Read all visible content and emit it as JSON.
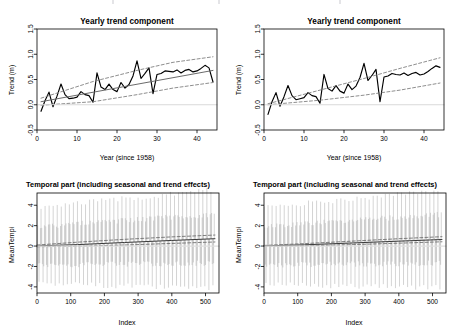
{
  "figure": {
    "layout": "2x2 panel grid",
    "background_color": "#ffffff",
    "panels": [
      {
        "id": "top-left",
        "title": "Yearly trend component",
        "xlabel": "Year (since 1958)",
        "ylabel": "Trend (m)"
      },
      {
        "id": "top-right",
        "title": "Yearly trend component",
        "xlabel": "Year (since 1958)",
        "ylabel": "Trend (m)"
      },
      {
        "id": "bottom-left",
        "title": "Temporal part (including seasonal and trend effects)",
        "xlabel": "Index",
        "ylabel": "MeanTempi"
      },
      {
        "id": "bottom-right",
        "title": "Temporal part (including seasonal and trend effects)",
        "xlabel": "Index",
        "ylabel": "MeanTempi"
      }
    ]
  },
  "colors": {
    "data_line": "#000000",
    "fit_line": "#6b6b6b",
    "confidence_dashed": "#7a7a7a",
    "spike": "#a8a8a8",
    "zero_line": "#d9d9d9",
    "axis": "#000000",
    "background": "#ffffff"
  },
  "chart_data": [
    {
      "type": "line",
      "id": "top-left",
      "title": "Yearly trend component",
      "xlabel": "Year (since 1958)",
      "ylabel": "Trend (m)",
      "grid": false,
      "legend": "none",
      "xlim": [
        0,
        45
      ],
      "ylim": [
        -0.5,
        1.5
      ],
      "xticks": [
        0,
        10,
        20,
        30,
        40
      ],
      "yticks": [
        -0.5,
        0.0,
        0.5,
        1.0,
        1.5
      ],
      "ytick_labels": [
        "-0.5",
        "0.0",
        "0.5",
        "1.0",
        "1.5"
      ],
      "xtick_labels": [
        "0",
        "10",
        "20",
        "30",
        "40"
      ],
      "series": [
        {
          "name": "yearly trend (observed)",
          "style": "solid",
          "color": "#000000",
          "x": [
            1,
            2,
            3,
            4,
            5,
            6,
            7,
            8,
            9,
            10,
            11,
            12,
            13,
            14,
            15,
            16,
            17,
            18,
            19,
            20,
            21,
            22,
            23,
            24,
            25,
            26,
            27,
            28,
            29,
            30,
            31,
            32,
            33,
            34,
            35,
            36,
            37,
            38,
            39,
            40,
            41,
            42,
            43,
            44
          ],
          "y": [
            -0.13,
            0.08,
            0.25,
            -0.04,
            0.17,
            0.41,
            0.2,
            0.12,
            0.13,
            0.15,
            0.26,
            0.2,
            0.18,
            0.05,
            0.63,
            0.35,
            0.3,
            0.41,
            0.3,
            0.26,
            0.44,
            0.33,
            0.4,
            0.57,
            0.87,
            0.52,
            0.62,
            0.73,
            0.22,
            0.6,
            0.62,
            0.67,
            0.66,
            0.65,
            0.69,
            0.63,
            0.68,
            0.7,
            0.65,
            0.67,
            0.72,
            0.78,
            0.73,
            0.45
          ]
        },
        {
          "name": "fitted linear trend",
          "style": "solid",
          "color": "#6b6b6b",
          "x": [
            1,
            44
          ],
          "y": [
            0.06,
            0.68
          ]
        },
        {
          "name": "upper confidence band",
          "style": "dashed",
          "color": "#7a7a7a",
          "x": [
            1,
            14,
            25,
            34,
            44
          ],
          "y": [
            0.13,
            0.46,
            0.68,
            0.84,
            0.95
          ]
        },
        {
          "name": "lower confidence band",
          "style": "dashed",
          "color": "#7a7a7a",
          "x": [
            1,
            14,
            25,
            34,
            44
          ],
          "y": [
            -0.01,
            0.06,
            0.2,
            0.33,
            0.44
          ]
        },
        {
          "name": "zero reference",
          "style": "solid-light",
          "color": "#d9d9d9",
          "x": [
            0,
            45
          ],
          "y": [
            0,
            0
          ]
        }
      ]
    },
    {
      "type": "line",
      "id": "top-right",
      "title": "Yearly trend component",
      "xlabel": "Year (since 1958)",
      "ylabel": "Trend (m)",
      "grid": false,
      "legend": "none",
      "xlim": [
        0,
        45
      ],
      "ylim": [
        -0.5,
        1.5
      ],
      "xticks": [
        0,
        10,
        20,
        30,
        40
      ],
      "yticks": [
        -0.5,
        0.0,
        0.5,
        1.0,
        1.5
      ],
      "ytick_labels": [
        "-0.5",
        "0.0",
        "0.5",
        "1.0",
        "1.5"
      ],
      "xtick_labels": [
        "0",
        "10",
        "20",
        "30",
        "40"
      ],
      "series": [
        {
          "name": "yearly trend (observed)",
          "style": "solid",
          "color": "#000000",
          "x": [
            1,
            2,
            3,
            4,
            5,
            6,
            7,
            8,
            9,
            10,
            11,
            12,
            13,
            14,
            15,
            16,
            17,
            18,
            19,
            20,
            21,
            22,
            23,
            24,
            25,
            26,
            27,
            28,
            29,
            30,
            31,
            32,
            33,
            34,
            35,
            36,
            37,
            38,
            39,
            40,
            41,
            42,
            43,
            44
          ],
          "y": [
            -0.19,
            0.06,
            0.24,
            -0.03,
            0.16,
            0.38,
            0.18,
            0.1,
            0.12,
            0.14,
            0.24,
            0.18,
            0.16,
            0.03,
            0.6,
            0.32,
            0.27,
            0.38,
            0.27,
            0.23,
            0.41,
            0.3,
            0.37,
            0.54,
            0.82,
            0.48,
            0.58,
            0.7,
            0.06,
            0.55,
            0.57,
            0.62,
            0.6,
            0.59,
            0.63,
            0.58,
            0.62,
            0.64,
            0.59,
            0.61,
            0.66,
            0.72,
            0.77,
            0.74
          ]
        },
        {
          "name": "upper confidence band",
          "style": "dashed",
          "color": "#7a7a7a",
          "x": [
            1,
            14,
            25,
            34,
            44
          ],
          "y": [
            0.02,
            0.29,
            0.52,
            0.72,
            0.93
          ]
        },
        {
          "name": "lower confidence band",
          "style": "dashed",
          "color": "#7a7a7a",
          "x": [
            1,
            14,
            25,
            34,
            44
          ],
          "y": [
            0.0,
            0.09,
            0.19,
            0.29,
            0.43
          ]
        },
        {
          "name": "zero reference",
          "style": "solid-light",
          "color": "#d9d9d9",
          "x": [
            0,
            45
          ],
          "y": [
            0,
            0
          ]
        }
      ]
    },
    {
      "type": "line",
      "id": "bottom-left",
      "title": "Temporal part (including seasonal and trend effects)",
      "xlabel": "Index",
      "ylabel": "MeanTempi",
      "grid": false,
      "legend": "none",
      "xlim": [
        0,
        540
      ],
      "ylim": [
        -4.6,
        5.2
      ],
      "xticks": [
        0,
        100,
        200,
        300,
        400,
        500
      ],
      "yticks": [
        -4,
        -2,
        0,
        2,
        4
      ],
      "ytick_labels": [
        "-4",
        "-2",
        "0",
        "2",
        "4"
      ],
      "xtick_labels": [
        "0",
        "100",
        "200",
        "300",
        "400",
        "500"
      ],
      "seasonal": {
        "description": "dense monthly seasonal oscillation drawn as vertical spikes",
        "n_points": 528,
        "period": 12,
        "amplitude_start": 2.6,
        "amplitude_end": 3.3,
        "color": "#a8a8a8"
      },
      "series": [
        {
          "name": "fitted trend",
          "style": "solid",
          "color": "#3a3a3a",
          "x": [
            0,
            120,
            260,
            400,
            528
          ],
          "y": [
            0.02,
            0.14,
            0.35,
            0.55,
            0.72
          ]
        },
        {
          "name": "upper confidence band",
          "style": "dashed",
          "color": "#6b6b6b",
          "x": [
            0,
            120,
            260,
            400,
            528
          ],
          "y": [
            0.1,
            0.38,
            0.66,
            0.9,
            1.08
          ]
        },
        {
          "name": "lower confidence band",
          "style": "dashed",
          "color": "#6b6b6b",
          "x": [
            0,
            120,
            260,
            400,
            528
          ],
          "y": [
            -0.06,
            -0.02,
            0.1,
            0.26,
            0.4
          ]
        },
        {
          "name": "zero reference",
          "style": "solid-light",
          "color": "#e0e0e0",
          "x": [
            0,
            540
          ],
          "y": [
            0,
            0
          ]
        }
      ]
    },
    {
      "type": "line",
      "id": "bottom-right",
      "title": "Temporal part (including seasonal and trend effects)",
      "xlabel": "Index",
      "ylabel": "MeanTempi",
      "grid": false,
      "legend": "none",
      "xlim": [
        0,
        540
      ],
      "ylim": [
        -4.6,
        5.2
      ],
      "xticks": [
        0,
        100,
        200,
        300,
        400,
        500
      ],
      "yticks": [
        -4,
        -2,
        0,
        2,
        4
      ],
      "ytick_labels": [
        "-4",
        "-2",
        "0",
        "2",
        "4"
      ],
      "xtick_labels": [
        "0",
        "100",
        "200",
        "300",
        "400",
        "500"
      ],
      "seasonal": {
        "description": "dense monthly seasonal oscillation drawn as vertical spikes",
        "n_points": 528,
        "period": 12,
        "amplitude_start": 2.6,
        "amplitude_end": 3.3,
        "color": "#a8a8a8"
      },
      "series": [
        {
          "name": "fitted trend",
          "style": "solid",
          "color": "#3a3a3a",
          "x": [
            0,
            120,
            260,
            400,
            528
          ],
          "y": [
            0.02,
            0.12,
            0.3,
            0.48,
            0.64
          ]
        },
        {
          "name": "upper confidence band",
          "style": "dashed",
          "color": "#6b6b6b",
          "x": [
            0,
            120,
            260,
            400,
            528
          ],
          "y": [
            0.06,
            0.24,
            0.48,
            0.72,
            0.92
          ]
        },
        {
          "name": "lower confidence band",
          "style": "dashed",
          "color": "#6b6b6b",
          "x": [
            0,
            120,
            260,
            400,
            528
          ],
          "y": [
            -0.02,
            0.02,
            0.14,
            0.28,
            0.42
          ]
        },
        {
          "name": "zero reference",
          "style": "solid-light",
          "color": "#e0e0e0",
          "x": [
            0,
            540
          ],
          "y": [
            0,
            0
          ]
        }
      ]
    }
  ]
}
